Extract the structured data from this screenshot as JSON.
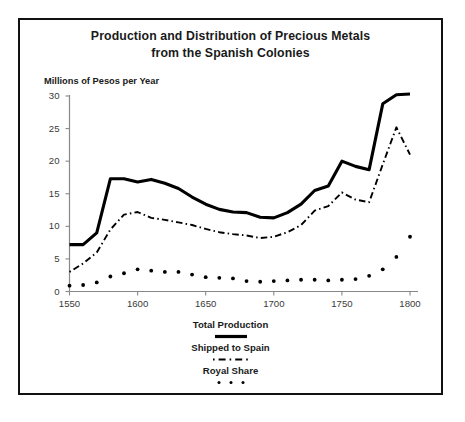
{
  "chart_data": {
    "type": "line",
    "title": "Production and Distribution of Precious Metals from the Spanish Colonies",
    "title_line1": "Production and Distribution of Precious Metals",
    "title_line2": "from the Spanish Colonies",
    "ylabel": "Millions of Pesos per Year",
    "xlabel": "",
    "xlim": [
      1550,
      1800
    ],
    "ylim": [
      0,
      30
    ],
    "yticks": [
      0,
      5,
      10,
      15,
      20,
      25,
      30
    ],
    "ytick_labels": [
      "0",
      "5",
      "10",
      "15",
      "20",
      "25",
      "30"
    ],
    "xticks": [
      1550,
      1600,
      1650,
      1700,
      1750,
      1800
    ],
    "xtick_labels": [
      "1550",
      "1600",
      "1650",
      "1700",
      "1750",
      "1800"
    ],
    "grid": false,
    "legend_position": "below-center",
    "x": [
      1550,
      1560,
      1570,
      1580,
      1590,
      1600,
      1610,
      1620,
      1630,
      1640,
      1650,
      1660,
      1670,
      1680,
      1690,
      1700,
      1710,
      1720,
      1730,
      1740,
      1750,
      1760,
      1770,
      1780,
      1790,
      1800
    ],
    "series": [
      {
        "name": "Total Production",
        "style": "solid",
        "color": "#000000",
        "values": [
          7.2,
          7.2,
          9.0,
          17.3,
          17.3,
          16.8,
          17.2,
          16.6,
          15.8,
          14.5,
          13.4,
          12.6,
          12.2,
          12.1,
          11.4,
          11.3,
          12.1,
          13.4,
          15.5,
          16.2,
          20.0,
          19.2,
          18.7,
          28.8,
          30.2,
          30.3
        ]
      },
      {
        "name": "Shipped to Spain",
        "style": "dashdot",
        "color": "#000000",
        "values": [
          3.0,
          4.3,
          6.0,
          9.5,
          11.8,
          12.2,
          11.3,
          11.0,
          10.6,
          10.2,
          9.6,
          9.1,
          8.8,
          8.6,
          8.2,
          8.4,
          9.1,
          10.2,
          12.4,
          13.1,
          15.2,
          14.1,
          13.7,
          19.5,
          25.2,
          21.0
        ]
      },
      {
        "name": "Royal Share",
        "style": "dotted",
        "color": "#000000",
        "values": [
          0.9,
          1.0,
          1.4,
          2.3,
          2.8,
          3.4,
          3.2,
          3.0,
          3.0,
          2.6,
          2.2,
          2.1,
          2.0,
          1.6,
          1.5,
          1.6,
          1.7,
          1.8,
          1.8,
          1.7,
          1.8,
          1.9,
          2.4,
          3.4,
          5.3,
          8.4
        ]
      }
    ]
  },
  "legend": {
    "items": [
      {
        "label": "Total Production",
        "style": "solid"
      },
      {
        "label": "Shipped to Spain",
        "style": "dashdot"
      },
      {
        "label": "Royal Share",
        "style": "dotted"
      }
    ]
  }
}
